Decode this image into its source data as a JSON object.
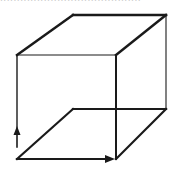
{
  "figure": {
    "cropped_caption_text": "..........................................",
    "colors": {
      "stroke": "#1a1a1a",
      "background": "#ffffff"
    },
    "vertices": {
      "front_top_left": [
        17,
        55
      ],
      "front_top_right": [
        116,
        55
      ],
      "front_bottom_left": [
        17,
        159
      ],
      "front_bottom_right": [
        116,
        159
      ],
      "back_top_left": [
        73,
        15
      ],
      "back_top_right": [
        166,
        15
      ],
      "back_bottom_left": [
        73,
        109
      ],
      "back_bottom_right": [
        166,
        109
      ]
    },
    "edges": [
      {
        "name": "top-back-edge",
        "from": [
          73,
          15
        ],
        "to": [
          166,
          15
        ],
        "width": 2.4
      },
      {
        "name": "top-left-edge",
        "from": [
          17,
          55
        ],
        "to": [
          73,
          15
        ],
        "width": 2.4
      },
      {
        "name": "top-right-edge",
        "from": [
          116,
          55
        ],
        "to": [
          166,
          15
        ],
        "width": 2.4
      },
      {
        "name": "front-top-edge",
        "from": [
          17,
          55
        ],
        "to": [
          116,
          55
        ],
        "width": 1.2
      },
      {
        "name": "front-right-edge",
        "from": [
          116,
          55
        ],
        "to": [
          116,
          159
        ],
        "width": 2
      },
      {
        "name": "back-right-edge",
        "from": [
          166,
          15
        ],
        "to": [
          166,
          109
        ],
        "width": 1.1
      },
      {
        "name": "front-left-edge-upper",
        "from": [
          17,
          55
        ],
        "to": [
          17,
          130
        ],
        "width": 1.4
      },
      {
        "name": "front-left-edge-lower",
        "from": [
          17,
          130
        ],
        "to": [
          17,
          147
        ],
        "width": 1.6
      },
      {
        "name": "bottom-back-edge",
        "from": [
          73,
          109
        ],
        "to": [
          166,
          109
        ],
        "width": 2.2
      },
      {
        "name": "bottom-left-edge",
        "from": [
          17,
          159
        ],
        "to": [
          73,
          109
        ],
        "width": 2.2
      },
      {
        "name": "bottom-right-edge",
        "from": [
          116,
          159
        ],
        "to": [
          166,
          109
        ],
        "width": 2.2
      },
      {
        "name": "bottom-front-edge",
        "from": [
          17,
          159
        ],
        "to": [
          106,
          159
        ],
        "width": 2.2
      }
    ],
    "arrows": [
      {
        "name": "up-arrow",
        "direction": "up",
        "tip": [
          17,
          126
        ]
      },
      {
        "name": "right-arrow",
        "direction": "right",
        "tip": [
          115,
          159
        ]
      }
    ]
  }
}
